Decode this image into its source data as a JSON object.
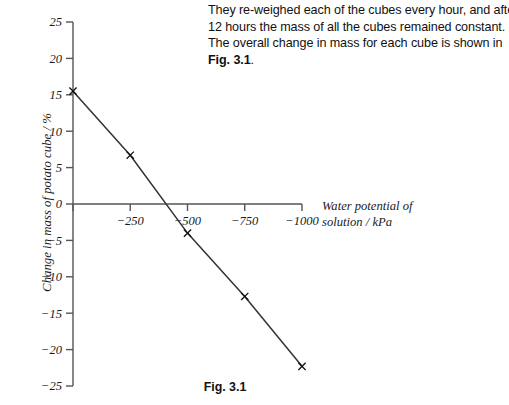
{
  "intro": {
    "lines": [
      "They re-weighed each of the cubes every hour, and after",
      "12 hours the mass of all the cubes remained constant.",
      "The overall change in mass for each cube is shown in"
    ],
    "fig_ref": "Fig. 3.1",
    "fig_ref_tail": "."
  },
  "caption": "Fig. 3.1",
  "axis": {
    "y_title": "Change in mass of potato cube / %",
    "x_title_line1": "Water potential of",
    "x_title_line2": "solution / kPa"
  },
  "colors": {
    "line": "#333333",
    "axis": "#555555",
    "text": "#1a1a1a",
    "background": "#ffffff"
  },
  "chart_data": {
    "type": "line",
    "title": "Fig. 3.1",
    "xlabel": "Water potential of solution / kPa",
    "ylabel": "Change in mass of potato cube / %",
    "xlim": [
      0,
      -1000
    ],
    "ylim": [
      -25,
      25
    ],
    "grid": false,
    "legend": null,
    "marker": "x",
    "x": [
      0,
      -250,
      -500,
      -750,
      -1000
    ],
    "y": [
      15.5,
      6.7,
      -4.0,
      -12.7,
      -22.3
    ],
    "xticks": [
      0,
      -250,
      -500,
      -750,
      -1000
    ],
    "xtick_labels": [
      "",
      "−250",
      "−500",
      "−750",
      "−1000"
    ],
    "yticks": [
      25,
      20,
      15,
      10,
      5,
      0,
      -5,
      -10,
      -15,
      -20,
      -25
    ],
    "ytick_labels": [
      "25",
      "20",
      "15",
      "10",
      "5",
      "0",
      "−5",
      "−10",
      "−15",
      "−20",
      "−25"
    ]
  }
}
